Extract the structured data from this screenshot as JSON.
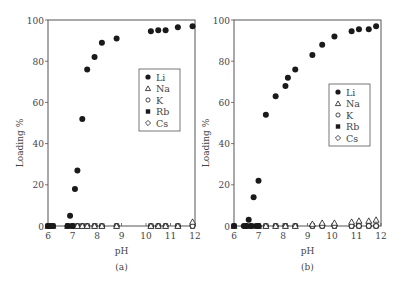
{
  "chart_data": [
    {
      "type": "scatter",
      "panel_label": "(a)",
      "title": "",
      "xlabel": "pH",
      "ylabel": "Loading %",
      "xlim": [
        6,
        12
      ],
      "ylim": [
        0,
        100
      ],
      "xticks": [
        6,
        7,
        8,
        9,
        10,
        11,
        12
      ],
      "yticks": [
        0,
        20,
        40,
        60,
        80,
        100
      ],
      "grid": false,
      "legend_position": "right-middle",
      "legend": [
        "Li",
        "Na",
        "K",
        "Rb",
        "Cs"
      ],
      "series": [
        {
          "name": "Li",
          "marker": "filled-circle",
          "x": [
            6.0,
            6.1,
            6.2,
            6.8,
            6.9,
            7.0,
            7.1,
            7.2,
            7.4,
            7.6,
            7.9,
            8.2,
            8.8,
            10.2,
            10.5,
            10.8,
            11.3,
            11.9
          ],
          "y": [
            0,
            0,
            0,
            0,
            5,
            0,
            18,
            27,
            52,
            76,
            82,
            89,
            91,
            94.5,
            95,
            95,
            96.5,
            97
          ]
        },
        {
          "name": "Na",
          "marker": "open-triangle",
          "x": [
            6.0,
            6.2,
            6.8,
            7.0,
            7.2,
            7.4,
            7.6,
            7.9,
            8.2,
            8.8,
            10.2,
            10.5,
            10.8,
            11.3,
            11.9
          ],
          "y": [
            0,
            0,
            0,
            0,
            0,
            0,
            0,
            0,
            0,
            0,
            0,
            0,
            0,
            0,
            2
          ]
        },
        {
          "name": "K",
          "marker": "open-circle",
          "x": [
            6.0,
            6.2,
            6.8,
            7.0,
            7.2,
            7.4,
            7.6,
            7.9,
            8.2,
            8.8,
            10.2,
            10.5,
            10.8,
            11.3,
            11.9
          ],
          "y": [
            0,
            0,
            0,
            0,
            0,
            0,
            0,
            0,
            0,
            0,
            0,
            0,
            0,
            0,
            0
          ]
        },
        {
          "name": "Rb",
          "marker": "filled-square",
          "x": [
            6.0,
            6.2,
            6.8,
            7.0,
            7.2,
            7.4,
            7.6,
            7.9,
            8.2,
            8.8,
            10.2,
            10.5,
            10.8,
            11.3,
            11.9
          ],
          "y": [
            0,
            0,
            0,
            0,
            0,
            0,
            0,
            0,
            0,
            0,
            0,
            0,
            0,
            0,
            0
          ]
        },
        {
          "name": "Cs",
          "marker": "open-diamond",
          "x": [
            6.0,
            6.2,
            6.8,
            7.0,
            7.2,
            7.4,
            7.6,
            7.9,
            8.2,
            8.8,
            10.2,
            10.5,
            10.8,
            11.3,
            11.9
          ],
          "y": [
            0,
            0,
            0,
            0,
            0,
            0,
            0,
            0,
            0,
            0,
            0,
            0,
            0,
            0,
            0
          ]
        }
      ]
    },
    {
      "type": "scatter",
      "panel_label": "(b)",
      "title": "",
      "xlabel": "pH",
      "ylabel": "Loading %",
      "xlim": [
        6,
        12
      ],
      "ylim": [
        0,
        100
      ],
      "xticks": [
        6,
        7,
        8,
        9,
        10,
        11,
        12
      ],
      "yticks": [
        0,
        20,
        40,
        60,
        80,
        100
      ],
      "grid": false,
      "legend_position": "right-lower",
      "legend": [
        "Li",
        "Na",
        "K",
        "Rb",
        "Cs"
      ],
      "series": [
        {
          "name": "Li",
          "marker": "filled-circle",
          "x": [
            6.0,
            6.4,
            6.5,
            6.6,
            6.7,
            6.8,
            6.9,
            7.0,
            7.0,
            7.3,
            7.7,
            8.1,
            8.2,
            8.5,
            9.2,
            9.6,
            10.1,
            10.8,
            11.1,
            11.5,
            11.8
          ],
          "y": [
            0,
            0,
            0,
            3,
            0,
            14,
            0,
            22,
            0,
            54,
            63,
            68,
            72,
            76,
            83,
            88,
            92,
            94.5,
            95.5,
            95.5,
            97
          ]
        },
        {
          "name": "Na",
          "marker": "open-triangle",
          "x": [
            6.0,
            6.5,
            6.7,
            7.0,
            7.3,
            7.7,
            8.1,
            8.5,
            9.2,
            9.6,
            10.1,
            10.8,
            11.1,
            11.5,
            11.8
          ],
          "y": [
            0,
            0,
            0,
            0,
            0,
            0,
            0,
            0,
            1,
            1.5,
            1.5,
            2,
            2.5,
            2.5,
            3
          ]
        },
        {
          "name": "K",
          "marker": "open-circle",
          "x": [
            6.0,
            6.5,
            6.7,
            7.0,
            7.3,
            7.7,
            8.1,
            8.5,
            9.2,
            9.6,
            10.1,
            10.8,
            11.1,
            11.5,
            11.8
          ],
          "y": [
            0,
            0,
            0,
            0,
            0,
            0,
            0,
            0,
            0,
            0,
            0,
            0,
            0,
            0,
            0
          ]
        },
        {
          "name": "Rb",
          "marker": "filled-square",
          "x": [
            6.0,
            6.5,
            6.7,
            7.0,
            7.3,
            7.7,
            8.1,
            8.5,
            9.2,
            9.6,
            10.1,
            10.8,
            11.1,
            11.5,
            11.8
          ],
          "y": [
            0,
            0,
            0,
            0,
            0,
            0,
            0,
            0,
            0,
            0,
            0,
            0,
            0,
            0,
            0
          ]
        },
        {
          "name": "Cs",
          "marker": "open-diamond",
          "x": [
            6.0,
            6.5,
            6.7,
            7.0,
            7.3,
            7.7,
            8.1,
            8.5,
            9.2,
            9.6,
            10.1,
            10.8,
            11.1,
            11.5,
            11.8
          ],
          "y": [
            0,
            0,
            0,
            0,
            0,
            0,
            0,
            0,
            0,
            0,
            0,
            0,
            0,
            0,
            0
          ]
        }
      ]
    }
  ],
  "panels": [
    {
      "label": "(a)",
      "xlabel": "pH",
      "ylabel": "Loading %",
      "legend_items": [
        "Li",
        "Na",
        "K",
        "Rb",
        "Cs"
      ]
    },
    {
      "label": "(b)",
      "xlabel": "pH",
      "ylabel": "Loading %",
      "legend_items": [
        "Li",
        "Na",
        "K",
        "Rb",
        "Cs"
      ]
    }
  ],
  "colors": {
    "axis": "#555555",
    "marker": "#1a1a1a",
    "text": "#444444"
  }
}
